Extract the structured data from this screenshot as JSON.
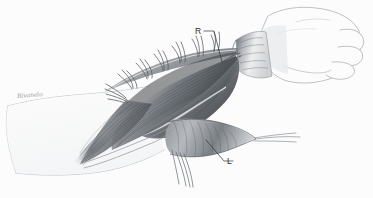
{
  "figure": {
    "kind": "anatomical-illustration",
    "medium": "graphite pencil drawing",
    "background_color": "#ffffff",
    "width": 373,
    "height": 198,
    "orientation": "forearm running from lower-left to upper-right, hand at upper right"
  },
  "labels": [
    {
      "id": "R",
      "text": "R",
      "x": 195,
      "y": 27,
      "leader": "elbow-style leader line running right then down to the proximal exposed structure",
      "color": "#2b2b2b"
    },
    {
      "id": "L",
      "text": "L",
      "x": 227,
      "y": 157,
      "leader": "short diagonal leader line running up-left to the distal tendinous band",
      "color": "#2b2b2b"
    }
  ],
  "signature": {
    "text": "Rivanelo",
    "legible": false,
    "note": "small cursive artist signature, illegible at this resolution",
    "color": "#8d8d93",
    "x": 17,
    "y": 92
  },
  "palette": {
    "paper": "#ffffff",
    "outline": "#9aa0a6",
    "outline_dark": "#5c6166",
    "muscle_light": "#c9ccd0",
    "muscle_mid": "#8b9095",
    "muscle_dark": "#4e5357",
    "muscle_deep": "#35393d",
    "suture": "#55595e",
    "label_ink": "#2b2b2b",
    "highlight": "#f2f3f4"
  },
  "anatomy": {
    "structures": [
      {
        "name": "hand",
        "description": "loosely outlined hand with flexed fingers at the upper right"
      },
      {
        "name": "wrist-cuff",
        "description": "banded wrist region with radiating fold lines"
      },
      {
        "name": "skin-flap",
        "description": "reflected skin flap held open along the upper margin"
      },
      {
        "name": "stay-sutures",
        "description": "seven paired thread loops retracting the flap edge"
      },
      {
        "name": "superficial-flexor-muscle-belly",
        "description": "large shaded muscle mass filling the centre of the wound"
      },
      {
        "name": "deep-muscle-group",
        "description": "darker fibres beneath the superficial layer"
      },
      {
        "name": "tendinous-band",
        "description": "broad fan-shaped tendon sheet in the distal lower field, labelled L"
      },
      {
        "name": "proximal-structure",
        "description": "cord-like structure near the wrist, labelled R"
      },
      {
        "name": "free-tendon-strands",
        "description": "thin filaments hanging from the distal wound margin"
      },
      {
        "name": "forearm-outline",
        "description": "faint contour of the unopened proximal forearm to the left"
      }
    ],
    "suture_count": 7
  }
}
